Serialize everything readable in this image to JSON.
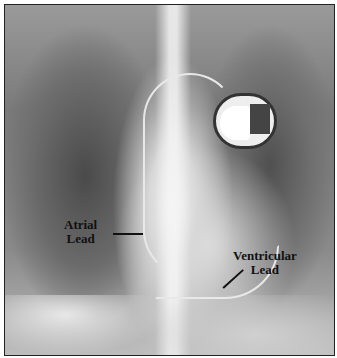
{
  "image": {
    "description": "Chest X-ray showing an implanted dual-chamber pacemaker with atrial and ventricular leads",
    "annotations": [
      {
        "label_line1": "Atrial",
        "label_line2": "Lead"
      },
      {
        "label_line1": "Ventricular",
        "label_line2": "Lead"
      }
    ]
  }
}
